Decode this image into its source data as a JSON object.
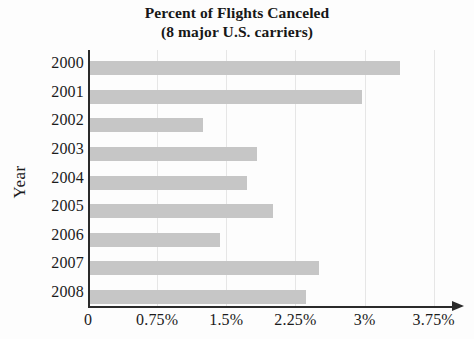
{
  "chart_data": {
    "type": "bar",
    "orientation": "horizontal",
    "title": "Percent of Flights Canceled",
    "subtitle": "(8 major U.S. carriers)",
    "title_lines": [
      "Percent of Flights Canceled",
      "(8 major U.S. carriers)"
    ],
    "xlabel": "",
    "ylabel": "Year",
    "categories": [
      "2000",
      "2001",
      "2002",
      "2003",
      "2004",
      "2005",
      "2006",
      "2007",
      "2008"
    ],
    "values": [
      3.38,
      2.97,
      1.25,
      1.83,
      1.72,
      2.01,
      1.43,
      2.51,
      2.36
    ],
    "value_unit": "%",
    "xlim": [
      0,
      4.1
    ],
    "xticks": [
      0,
      0.75,
      1.5,
      2.25,
      3,
      3.75
    ],
    "xtick_labels": [
      "0",
      "0.75%",
      "1.5%",
      "2.25%",
      "3%",
      "3.75%"
    ],
    "grid": "vertical",
    "legend": "none",
    "bar_color": "#c6c6c6",
    "axis_color": "#2b2b2b",
    "gridline_color": "#e6e6e6",
    "background_color": "#fdfdfd"
  }
}
